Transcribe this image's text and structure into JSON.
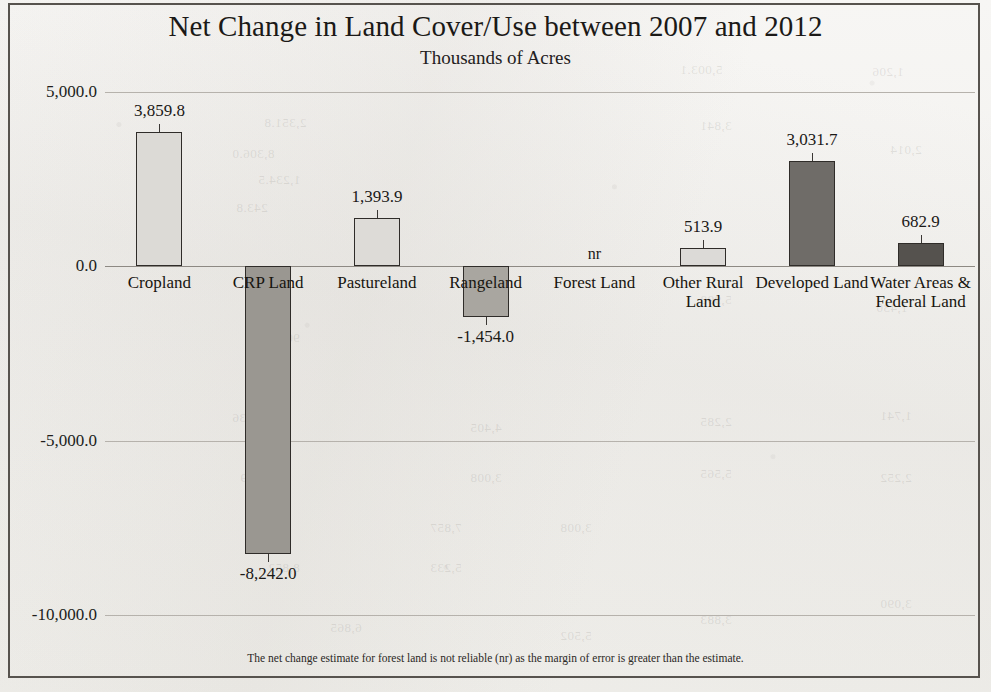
{
  "chart_data": {
    "type": "bar",
    "title": "Net Change in Land Cover/Use between 2007 and 2012",
    "subtitle": "Thousands of Acres",
    "xlabel": "",
    "ylabel": "",
    "ylim": [
      -10000,
      5000
    ],
    "ytick_labels": [
      "5,000.0",
      "0.0",
      "-5,000.0",
      "-10,000.0"
    ],
    "ytick_values": [
      5000,
      0,
      -5000,
      -10000
    ],
    "grid": true,
    "legend": "none",
    "categories": [
      "Cropland",
      "CRP Land",
      "Pastureland",
      "Rangeland",
      "Forest Land",
      "Other Rural Land",
      "Developed Land",
      "Water Areas & Federal Land"
    ],
    "values": [
      3859.8,
      -8242.0,
      1393.9,
      -1454.0,
      null,
      513.9,
      3031.7,
      682.9
    ],
    "data_labels": [
      "3,859.8",
      "-8,242.0",
      "1,393.9",
      "-1,454.0",
      "nr",
      "513.9",
      "3,031.7",
      "682.9"
    ],
    "bar_colors": [
      "#dcdad6",
      "#9a9791",
      "#dddbd7",
      "#a9a6a0",
      "none",
      "#dcdad7",
      "#6f6c68",
      "#55524e"
    ],
    "annotations": [
      {
        "text": "nr",
        "category": "Forest Land",
        "note": "not reliable"
      }
    ],
    "footnote": "The net change estimate for forest land is not reliable (nr) as the margin of error is greater than the estimate."
  },
  "ghost_text": [
    {
      "t": "2,351.8",
      "x": 264,
      "y": 115
    },
    {
      "t": "8,306.0",
      "x": 232,
      "y": 146
    },
    {
      "t": "1,234.5",
      "x": 258,
      "y": 172
    },
    {
      "t": "243.8",
      "x": 236,
      "y": 200
    },
    {
      "t": "5,003.1",
      "x": 680,
      "y": 62
    },
    {
      "t": "1,206",
      "x": 872,
      "y": 64
    },
    {
      "t": "3,841",
      "x": 700,
      "y": 118
    },
    {
      "t": "2,014",
      "x": 890,
      "y": 142
    },
    {
      "t": "908.2",
      "x": 268,
      "y": 330
    },
    {
      "t": "2,226",
      "x": 470,
      "y": 300
    },
    {
      "t": "5,998",
      "x": 700,
      "y": 292
    },
    {
      "t": "1,430",
      "x": 876,
      "y": 300
    },
    {
      "t": "9,336",
      "x": 232,
      "y": 410
    },
    {
      "t": "4,405",
      "x": 470,
      "y": 420
    },
    {
      "t": "2,285",
      "x": 700,
      "y": 414
    },
    {
      "t": "1,741",
      "x": 880,
      "y": 408
    },
    {
      "t": "3,009",
      "x": 240,
      "y": 470
    },
    {
      "t": "3,008",
      "x": 470,
      "y": 470
    },
    {
      "t": "5,565",
      "x": 700,
      "y": 466
    },
    {
      "t": "2,252",
      "x": 880,
      "y": 470
    },
    {
      "t": "7,857",
      "x": 430,
      "y": 520
    },
    {
      "t": "3,008",
      "x": 560,
      "y": 520
    },
    {
      "t": "8,852",
      "x": 268,
      "y": 560
    },
    {
      "t": "5,233",
      "x": 430,
      "y": 560
    },
    {
      "t": "3,090",
      "x": 880,
      "y": 596
    },
    {
      "t": "6,865",
      "x": 330,
      "y": 620
    },
    {
      "t": "5,502",
      "x": 560,
      "y": 628
    },
    {
      "t": "3,883",
      "x": 700,
      "y": 612
    }
  ]
}
